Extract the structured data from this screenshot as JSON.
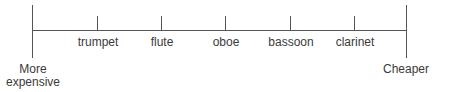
{
  "diagram": {
    "type": "ordinal-scale",
    "left_end_label_line1": "More",
    "left_end_label_line2": "expensive",
    "right_end_label": "Cheaper",
    "items": [
      {
        "label": "trumpet",
        "x": 97
      },
      {
        "label": "flute",
        "x": 161
      },
      {
        "label": "oboe",
        "x": 225
      },
      {
        "label": "bassoon",
        "x": 290
      },
      {
        "label": "clarinet",
        "x": 354
      }
    ],
    "line_color": "#555555",
    "text_color": "#3a3a3a"
  }
}
